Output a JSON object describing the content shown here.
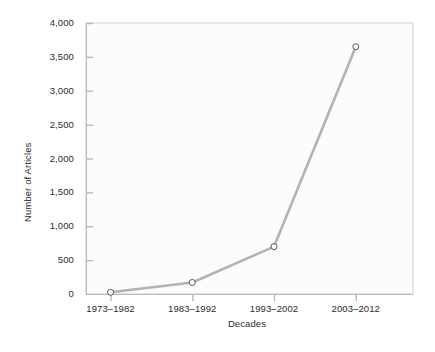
{
  "chart_data": {
    "type": "line",
    "title": "",
    "xlabel": "Decades",
    "ylabel": "Number of Articles",
    "categories": [
      "1973–1982",
      "1983–1992",
      "1993–2002",
      "2003–2012"
    ],
    "values": [
      25,
      170,
      700,
      3650
    ],
    "series": [
      {
        "name": "Number of Articles",
        "values": [
          25,
          170,
          700,
          3650
        ]
      }
    ],
    "ylim": [
      0,
      4000
    ],
    "yticks": [
      0,
      500,
      1000,
      1500,
      2000,
      2500,
      3000,
      3500,
      4000
    ],
    "ytick_labels": [
      "0",
      "500",
      "1,000",
      "1,500",
      "2,000",
      "2,500",
      "3,000",
      "3,500",
      "4,000"
    ],
    "xtick_labels": [
      "1973–1982",
      "1983–1992",
      "1993–2002",
      "2003–2012"
    ],
    "grid": false,
    "legend": "none",
    "marker": "open-circle",
    "colors": {
      "line": "#b3b3b3",
      "marker_edge": "#555555",
      "marker_fill": "#ffffff",
      "axis": "#c8c8c8",
      "panel": "#fcfcfc",
      "text": "#2b2b2b"
    }
  }
}
